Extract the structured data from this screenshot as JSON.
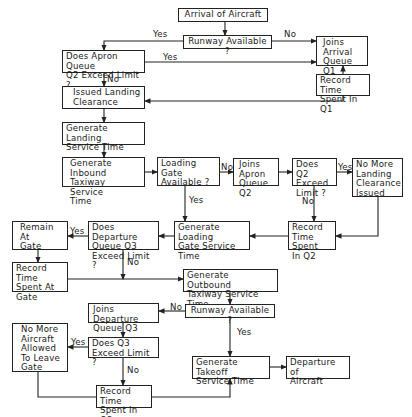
{
  "nodes": {
    "arrival": "Arrival of Aircraft",
    "runway_top": "Runway Available ?",
    "joins_q1": "Joins\nArrival\nQueue Q1",
    "record_q1": "Record Time\nSpent In Q1",
    "apron_limit": "Does Apron Queue\nQ2 Exceed Limit ?",
    "issued_clearance": "Issued Landing\nClearance",
    "gen_landing": "Generate Landing\nService Time",
    "gen_inbound": "Generate Inbound\nTaxiway Service\nTime",
    "loading_gate": "Loading Gate\nAvailable ?",
    "joins_q2": "Joins\nApron\nQueue Q2",
    "q2_limit": "Does Q2\nExceed\nLimit ?",
    "no_more_landing": "No More\nLanding\nClearance\nIssued",
    "record_q2": "Record\nTime Spent\nIn Q2",
    "gen_loading": "Generate Loading\nGate Service\nTime",
    "q3_dep_limit": "Does Departure\nQueue Q3\nExceed Limit ?",
    "remain_gate": "Remain At\nGate",
    "record_gate": "Record Time\nSpent At\nGate",
    "gen_outbound": "Generate Outbound\nTaxiway Service Time",
    "runway_bottom": "Runway Available ?",
    "joins_q3": "Joins Departure\nQueue Q3",
    "q3_limit": "Does Q3\nExceed Limit ?",
    "no_more_aircraft": "No More\nAircraft\nAllowed\nTo Leave\nGate",
    "record_q3": "Record Time\nSpent In Q3",
    "gen_takeoff": "Generate Takeoff\nService Time",
    "departure": "Departure of\nAircraft"
  },
  "labels": {
    "yes": "Yes",
    "no": "No"
  }
}
